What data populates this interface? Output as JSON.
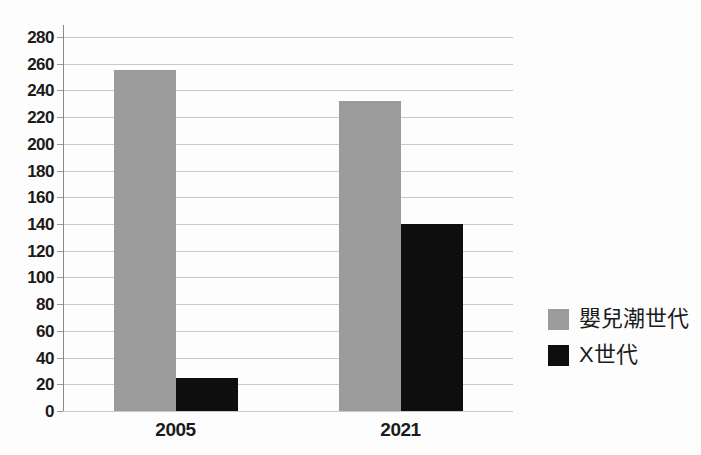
{
  "chart_data": {
    "type": "bar",
    "title": "",
    "xlabel": "",
    "ylabel": "",
    "categories": [
      "2005",
      "2021"
    ],
    "series": [
      {
        "name": "嬰兒潮世代",
        "color": "#9b9b9b",
        "values": [
          255,
          232
        ]
      },
      {
        "name": "X世代",
        "color": "#0e0e0e",
        "values": [
          25,
          140
        ]
      }
    ],
    "ylim": [
      0,
      280
    ],
    "ytick_step": 20,
    "ytick_labels": [
      "0",
      "20",
      "40",
      "60",
      "80",
      "100",
      "120",
      "140",
      "160",
      "180",
      "200",
      "220",
      "240",
      "260",
      "280"
    ],
    "grid": true,
    "legend_position": "right-middle"
  },
  "colors": {
    "background": "#fdfdfd",
    "gridline": "#c9c9c9",
    "axis": "#8a8a8a",
    "text": "#1b1b1b"
  }
}
